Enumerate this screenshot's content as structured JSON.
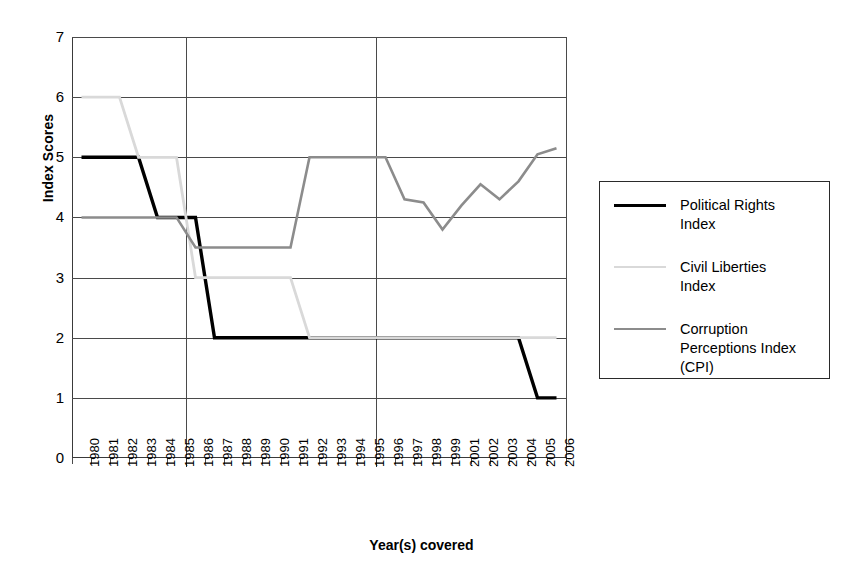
{
  "chart_data": {
    "type": "line",
    "title": "",
    "xlabel": "Year(s) covered",
    "ylabel": "Index Scores",
    "ylim": [
      0,
      7
    ],
    "yticks": [
      0,
      1,
      2,
      3,
      4,
      5,
      6,
      7
    ],
    "grid": true,
    "legend_position": "right",
    "categories": [
      "1980",
      "1981",
      "1982",
      "1983",
      "1984",
      "1985",
      "1986",
      "1987",
      "1988",
      "1989",
      "1990",
      "1991",
      "1992",
      "1993",
      "1994",
      "1995",
      "1996",
      "1997",
      "1998",
      "1999",
      "2001",
      "2002",
      "2003",
      "2004",
      "2005",
      "2006"
    ],
    "series": [
      {
        "name": "Political Rights Index",
        "color": "#000000",
        "values": [
          5,
          5,
          5,
          5,
          4,
          4,
          4,
          2,
          2,
          2,
          2,
          2,
          2,
          2,
          2,
          2,
          2,
          2,
          2,
          2,
          2,
          2,
          2,
          2,
          1,
          1
        ]
      },
      {
        "name": "Civil Liberties Index",
        "color": "#d9d9d9",
        "values": [
          6,
          6,
          6,
          5,
          5,
          5,
          3,
          3,
          3,
          3,
          3,
          3,
          2,
          2,
          2,
          2,
          2,
          2,
          2,
          2,
          2,
          2,
          2,
          2,
          2,
          2
        ]
      },
      {
        "name": "Corruption Perceptions Index (CPI)",
        "color": "#8c8c8c",
        "values": [
          4,
          4,
          4,
          4,
          4,
          4,
          3.5,
          3.5,
          3.5,
          3.5,
          3.5,
          3.5,
          5,
          5,
          5,
          5,
          5,
          4.3,
          4.25,
          3.8,
          4.2,
          4.55,
          4.3,
          4.6,
          5.05,
          5.15
        ]
      }
    ]
  },
  "axis": {
    "y_title": "Index Scores",
    "x_title": "Year(s) covered",
    "y_tick_labels": [
      "7",
      "6",
      "5",
      "4",
      "3",
      "2",
      "1",
      "0"
    ],
    "x_tick_labels": [
      "1980",
      "1981",
      "1982",
      "1983",
      "1984",
      "1985",
      "1986",
      "1987",
      "1988",
      "1989",
      "1990",
      "1991",
      "1992",
      "1993",
      "1994",
      "1995",
      "1996",
      "1997",
      "1998",
      "1999",
      "2001",
      "2002",
      "2003",
      "2004",
      "2005",
      "2006"
    ]
  },
  "legend": {
    "entries": [
      {
        "label_line1": "Political Rights",
        "label_line2": "Index",
        "label_line3": "",
        "color": "#000000"
      },
      {
        "label_line1": "Civil Liberties",
        "label_line2": "Index",
        "label_line3": "",
        "color": "#d9d9d9"
      },
      {
        "label_line1": "Corruption",
        "label_line2": "Perceptions Index",
        "label_line3": "(CPI)",
        "color": "#8c8c8c"
      }
    ]
  }
}
